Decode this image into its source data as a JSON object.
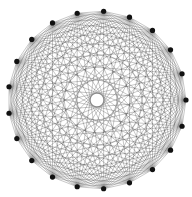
{
  "diagram": {
    "type": "complete-graph",
    "name": "K21",
    "node_count": 21,
    "layout": "circular",
    "center": [
      97,
      100
    ],
    "radius": 89,
    "start_angle_deg": 0,
    "edge_color": "#1a1a1a",
    "edge_opacity": 0.55,
    "edge_width": 0.45,
    "node_color": "#111111",
    "node_radius": 2.6,
    "background": "#ffffff"
  }
}
